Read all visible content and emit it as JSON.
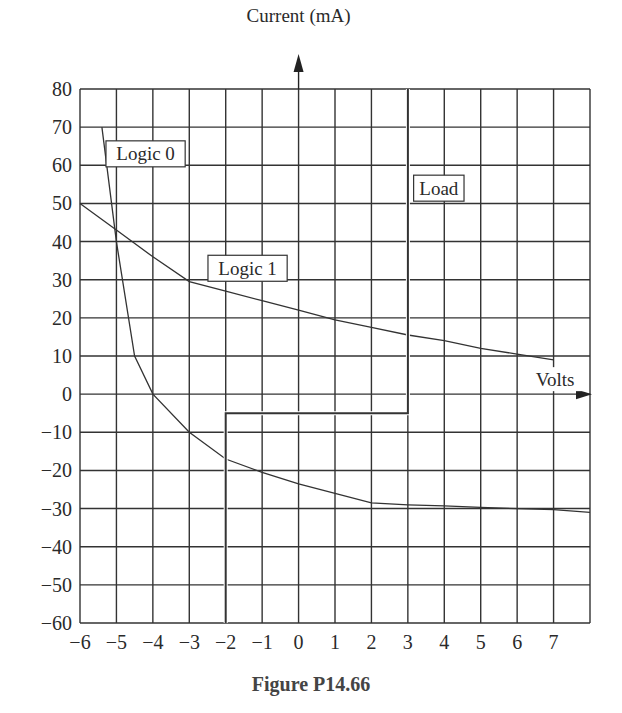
{
  "caption": "Figure P14.66",
  "chart_data": {
    "type": "line",
    "title": "",
    "xlabel": "Volts",
    "ylabel": "Current (mA)",
    "xlim": [
      -6,
      8
    ],
    "ylim": [
      -60,
      80
    ],
    "grid": true,
    "x_ticks": [
      -6,
      -5,
      -4,
      -3,
      -2,
      -1,
      0,
      1,
      2,
      3,
      4,
      5,
      6,
      7
    ],
    "x_tick_labels": [
      "−6",
      "−5",
      "−4",
      "−3",
      "−2",
      "−1",
      "0",
      "1",
      "2",
      "3",
      "4",
      "5",
      "6",
      "7"
    ],
    "y_ticks": [
      80,
      70,
      60,
      50,
      40,
      30,
      20,
      10,
      0,
      -10,
      -20,
      -30,
      -40,
      -50,
      -60
    ],
    "y_tick_labels": [
      "80",
      "70",
      "60",
      "50",
      "40",
      "30",
      "20",
      "10",
      "0",
      "−10",
      "−20",
      "−30",
      "−40",
      "−50",
      "−60"
    ],
    "legend": "inline labels",
    "series": [
      {
        "name": "Logic 0",
        "label_pos": [
          -4.2,
          63
        ],
        "points": [
          [
            -5.4,
            70
          ],
          [
            -5,
            40
          ],
          [
            -4.5,
            10
          ],
          [
            -4,
            0
          ],
          [
            -3,
            -10
          ],
          [
            -2,
            -17
          ],
          [
            -1,
            -20.5
          ],
          [
            0,
            -23.5
          ],
          [
            1,
            -26
          ],
          [
            2,
            -28.5
          ],
          [
            3,
            -29
          ],
          [
            4,
            -29.3
          ],
          [
            5,
            -29.7
          ],
          [
            6,
            -30
          ],
          [
            7,
            -30.3
          ],
          [
            8,
            -31
          ]
        ]
      },
      {
        "name": "Logic 1",
        "label_pos": [
          -1.4,
          33
        ],
        "points": [
          [
            -6,
            50
          ],
          [
            -5,
            43
          ],
          [
            -4,
            36
          ],
          [
            -3,
            29.5
          ],
          [
            -2,
            27
          ],
          [
            -1,
            24.5
          ],
          [
            0,
            22
          ],
          [
            1,
            19.5
          ],
          [
            2,
            17.5
          ],
          [
            3,
            15.5
          ],
          [
            4,
            14
          ],
          [
            5,
            12
          ],
          [
            6,
            10.5
          ],
          [
            7,
            9
          ]
        ]
      },
      {
        "name": "Load",
        "label_pos": [
          3.85,
          54
        ],
        "points": [
          [
            -2,
            -60
          ],
          [
            -2,
            -5
          ],
          [
            3,
            -5
          ],
          [
            3,
            80
          ]
        ]
      }
    ],
    "annotations": [
      "Logic 0",
      "Logic 1",
      "Load",
      "Volts",
      "Current (mA)"
    ]
  }
}
